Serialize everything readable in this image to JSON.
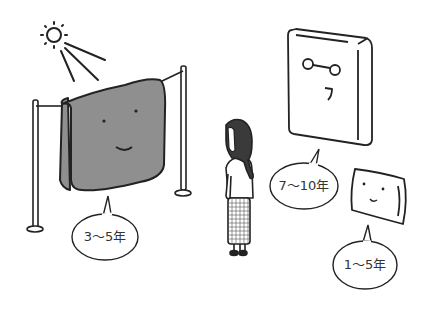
{
  "illustration": {
    "description": "Lifespan of bedding items",
    "colors": {
      "line": "#222222",
      "towel_fill": "#8f8f8f",
      "hair_fill": "#3a3a3a",
      "background": "#ffffff"
    },
    "items": [
      {
        "name": "futon-drying",
        "label": "3〜5年"
      },
      {
        "name": "mattress",
        "label": "7〜10年"
      },
      {
        "name": "pillow",
        "label": "1〜5年"
      }
    ]
  }
}
